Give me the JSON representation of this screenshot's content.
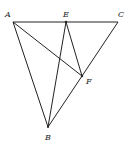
{
  "diagram": {
    "type": "geometry",
    "points": [
      {
        "id": "A",
        "label": "A"
      },
      {
        "id": "E",
        "label": "E"
      },
      {
        "id": "C",
        "label": "C"
      },
      {
        "id": "F",
        "label": "F"
      },
      {
        "id": "B",
        "label": "B"
      }
    ],
    "segments": [
      [
        "A",
        "E"
      ],
      [
        "E",
        "C"
      ],
      [
        "A",
        "B"
      ],
      [
        "A",
        "F"
      ],
      [
        "E",
        "B"
      ],
      [
        "E",
        "F"
      ],
      [
        "C",
        "F"
      ],
      [
        "F",
        "B"
      ]
    ],
    "relations": [
      "E lies on segment AC",
      "F lies on segment CB"
    ]
  }
}
